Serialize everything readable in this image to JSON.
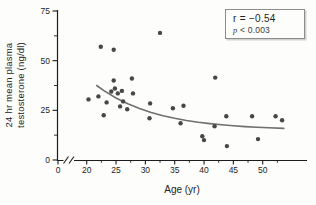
{
  "figure": {
    "y_axis_label_line1": "24 hr mean plasma",
    "y_axis_label_line2": "testosterone (ng/dl)",
    "x_axis_label": "Age (yr)",
    "legend": {
      "line1": "r = −0.54",
      "p_var": "p",
      "p_rest": " < 0.003"
    }
  },
  "chart_data": {
    "type": "scatter",
    "title": "",
    "xlabel": "Age (yr)",
    "ylabel": "24 hr mean plasma testosterone (ng/dl)",
    "annotation": {
      "r": "-0.54",
      "p": "< 0.003"
    },
    "xlim": [
      20,
      57
    ],
    "ylim": [
      0,
      75
    ],
    "x_axis_break_before": 20,
    "x_origin_label": "0",
    "x_ticks": [
      20,
      25,
      30,
      35,
      40,
      45,
      50
    ],
    "x_minor_ticks": [
      22.5,
      27.5,
      32.5,
      37.5,
      42.5,
      47.5,
      52.5
    ],
    "y_ticks": [
      0,
      25,
      50,
      75
    ],
    "y_minor_ticks": [
      12.5,
      37.5,
      62.5
    ],
    "grid": false,
    "legend_position": "top-right",
    "points": [
      [
        20.3,
        30.5
      ],
      [
        22.0,
        32.0
      ],
      [
        22.4,
        57.0
      ],
      [
        24.6,
        55.5
      ],
      [
        22.9,
        22.5
      ],
      [
        23.4,
        29.0
      ],
      [
        24.2,
        34.5
      ],
      [
        24.8,
        36.0
      ],
      [
        25.3,
        33.5
      ],
      [
        26.0,
        34.8
      ],
      [
        26.2,
        29.5
      ],
      [
        25.7,
        27.0
      ],
      [
        26.9,
        25.5
      ],
      [
        24.6,
        40.0
      ],
      [
        27.7,
        41.0
      ],
      [
        27.9,
        33.5
      ],
      [
        30.8,
        28.5
      ],
      [
        30.7,
        21.0
      ],
      [
        32.5,
        64.0
      ],
      [
        34.7,
        26.0
      ],
      [
        36.5,
        27.3
      ],
      [
        36.0,
        18.5
      ],
      [
        39.7,
        12.0
      ],
      [
        40.0,
        10.0
      ],
      [
        41.9,
        41.5
      ],
      [
        41.8,
        17.0
      ],
      [
        43.9,
        7.0
      ],
      [
        43.8,
        22.0
      ],
      [
        48.2,
        22.0
      ],
      [
        49.2,
        10.5
      ],
      [
        52.2,
        22.0
      ],
      [
        53.3,
        20.0
      ]
    ],
    "trend_curve": [
      [
        21.7,
        37.5
      ],
      [
        23.0,
        34.8
      ],
      [
        25.0,
        31.2
      ],
      [
        27.0,
        28.3
      ],
      [
        29.0,
        25.9
      ],
      [
        31.0,
        23.9
      ],
      [
        33.0,
        22.3
      ],
      [
        35.0,
        21.0
      ],
      [
        37.0,
        19.9
      ],
      [
        39.0,
        19.0
      ],
      [
        41.0,
        18.3
      ],
      [
        43.0,
        17.7
      ],
      [
        45.0,
        17.2
      ],
      [
        47.0,
        16.8
      ],
      [
        49.0,
        16.5
      ],
      [
        51.0,
        16.2
      ],
      [
        53.6,
        15.9
      ]
    ],
    "colors": {
      "point": "#474747",
      "curve": "#6f6f6f",
      "axis": "#1c1c1c",
      "tick_label": "#232323",
      "legend_border": "#8c8c8c"
    }
  }
}
